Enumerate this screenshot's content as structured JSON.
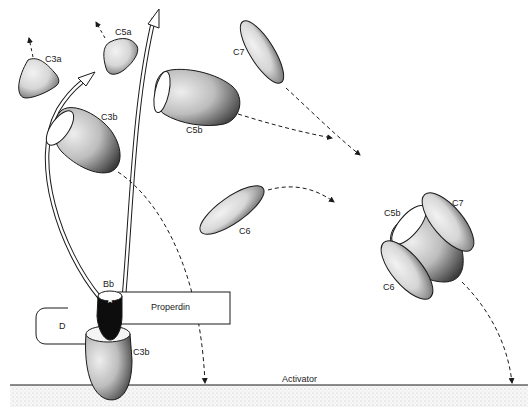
{
  "figure": {
    "type": "complement-pathway-diagram",
    "labels": {
      "c3a": "C3a",
      "c5a": "C5a",
      "c7_free": "C7",
      "c3b_free": "C3b",
      "c5b_free": "C5b",
      "c6_free": "C6",
      "c5b_complex": "C5b",
      "c7_complex": "C7",
      "c6_complex": "C6",
      "bb": "Bb",
      "properdin": "Properdin",
      "d": "D",
      "c3b_bound": "C3b",
      "activator": "Activator"
    },
    "colors": {
      "ink": "#1a1a1a",
      "stipple_light": "#e6e6e6",
      "stipple_mid": "#c8c8c8",
      "stipple_dark": "#555555",
      "bb_fill": "#0d0d0d",
      "surface": "#efefef"
    }
  }
}
